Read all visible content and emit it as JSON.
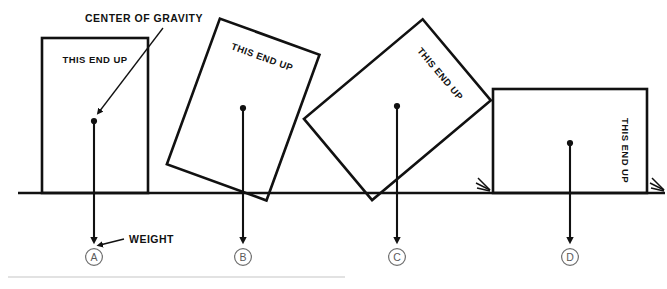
{
  "diagram": {
    "annotations": {
      "center_of_gravity": "CENTER OF GRAVITY",
      "weight": "WEIGHT"
    },
    "box_caption": "THIS END UP",
    "colors": {
      "ink": "#111111",
      "label_gray": "#5a5a5a",
      "rule_gray": "#d8d8d8",
      "background": "#ffffff"
    },
    "ground": {
      "y": 193,
      "x_start": 18,
      "x_end": 665
    },
    "footer_rule": {
      "y": 277,
      "x_start": 8,
      "x_end": 345
    },
    "cases": [
      {
        "id": "A",
        "label": "A",
        "caption": "THIS END UP",
        "rotation_deg": 0,
        "description": "upright box resting flat on the ground",
        "cg": {
          "x": 94,
          "y": 121
        },
        "weight_arrow_end_y": 243,
        "label_pos": {
          "x": 94,
          "y": 260
        }
      },
      {
        "id": "B",
        "label": "B",
        "caption": "THIS END UP",
        "rotation_deg": 20,
        "description": "box tilted, balancing on its lower right corner",
        "cg": {
          "x": 243,
          "y": 108
        },
        "weight_arrow_end_y": 243,
        "label_pos": {
          "x": 243,
          "y": 260
        }
      },
      {
        "id": "C",
        "label": "C",
        "caption": "THIS END UP",
        "rotation_deg": 50,
        "description": "box tipped about 50 degrees, resting on one corner",
        "cg": {
          "x": 397,
          "y": 106
        },
        "weight_arrow_end_y": 243,
        "label_pos": {
          "x": 397,
          "y": 260
        }
      },
      {
        "id": "D",
        "label": "D",
        "caption": "THIS END UP",
        "rotation_deg": 90,
        "description": "box lying on its side, caption reading vertically",
        "cg": {
          "x": 570,
          "y": 143
        },
        "weight_arrow_end_y": 243,
        "label_pos": {
          "x": 570,
          "y": 260
        }
      }
    ]
  }
}
